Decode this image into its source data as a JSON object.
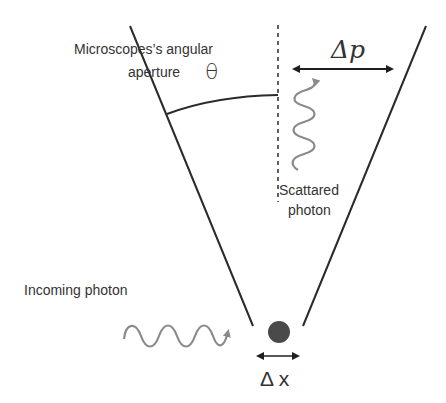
{
  "diagram": {
    "labels": {
      "aperture_line1": "Microscopes’s angular",
      "aperture_line2": "aperture",
      "theta": "θ",
      "delta_p": "Δp",
      "scattered_line1": "Scattared",
      "scattered_line2": "photon",
      "incoming": "Incoming photon",
      "delta_x": "Δ x"
    },
    "colors": {
      "line": "#2a2a2a",
      "wave": "#8a8a8a",
      "particle": "#4a4a4a",
      "text": "#333333",
      "background": "#ffffff"
    },
    "elements": [
      "cone-left-edge",
      "cone-right-edge",
      "optical-axis-dashed",
      "aperture-arc",
      "momentum-uncertainty-arrow",
      "scattered-photon-wave",
      "incoming-photon-wave",
      "electron-particle",
      "position-uncertainty-arrow"
    ]
  }
}
